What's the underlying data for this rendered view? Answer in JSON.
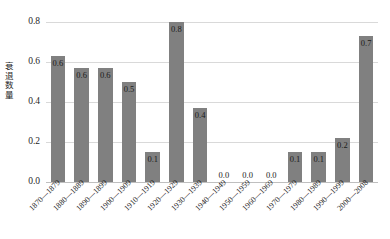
{
  "chart_data": {
    "type": "bar",
    "title": "",
    "subtitle": "",
    "xlabel": "",
    "ylabel": "衰退数量",
    "categories": [
      "1870—1879",
      "1880—1889",
      "1890—1899",
      "1900—1909",
      "1910—1919",
      "1920—1929",
      "1930—1939",
      "1940—1949",
      "1950—1959",
      "1960—1969",
      "1970—1979",
      "1980—1989",
      "1990—1999",
      "2000—2008"
    ],
    "values": [
      0.63,
      0.57,
      0.57,
      0.5,
      0.15,
      0.8,
      0.37,
      0,
      0,
      0,
      0.15,
      0.15,
      0.22,
      0.73
    ],
    "data_labels": [
      "0.6",
      "0.6",
      "0.6",
      "0.5",
      "0.1",
      "0.8",
      "0.4",
      "0.0",
      "0.0",
      "0.0",
      "0.1",
      "0.1",
      "0.2",
      "0.7"
    ],
    "ylim": [
      0.0,
      0.8
    ],
    "yticks": [
      0.0,
      0.2,
      0.4,
      0.6,
      0.8
    ],
    "ytick_labels": [
      "0.0",
      "0.2",
      "0.4",
      "0.6",
      "0.8"
    ],
    "grid": true,
    "grid_axis": "y",
    "legend": false,
    "legend_position": "none",
    "bar_color": "#808080",
    "gridline_color": "#D9D9D9",
    "background_color": "#FFFFFF",
    "text_color": "#1F1F1F",
    "xtick_rotation": -45
  }
}
